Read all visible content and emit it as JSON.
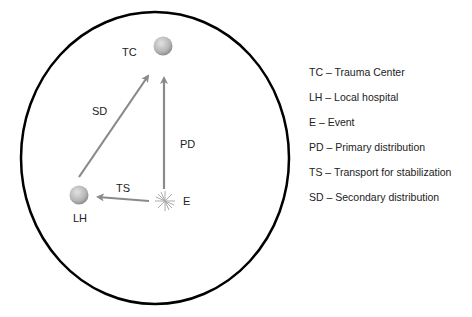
{
  "diagram": {
    "nodes": {
      "tc": {
        "label": "TC"
      },
      "lh": {
        "label": "LH"
      },
      "e": {
        "label": "E"
      }
    },
    "edges": {
      "sd": {
        "label": "SD"
      },
      "pd": {
        "label": "PD"
      },
      "ts": {
        "label": "TS"
      }
    },
    "colors": {
      "boundary": "#000000",
      "arrow": "#8a8a8a",
      "node": "#b9b9b9",
      "star": "#aaaaaa"
    }
  },
  "legend": {
    "items": [
      {
        "text": "TC – Trauma Center"
      },
      {
        "text": "LH – Local hospital"
      },
      {
        "text": "E – Event"
      },
      {
        "text": "PD – Primary distribution"
      },
      {
        "text": "TS – Transport for stabilization"
      },
      {
        "text": "SD – Secondary distribution"
      }
    ]
  }
}
